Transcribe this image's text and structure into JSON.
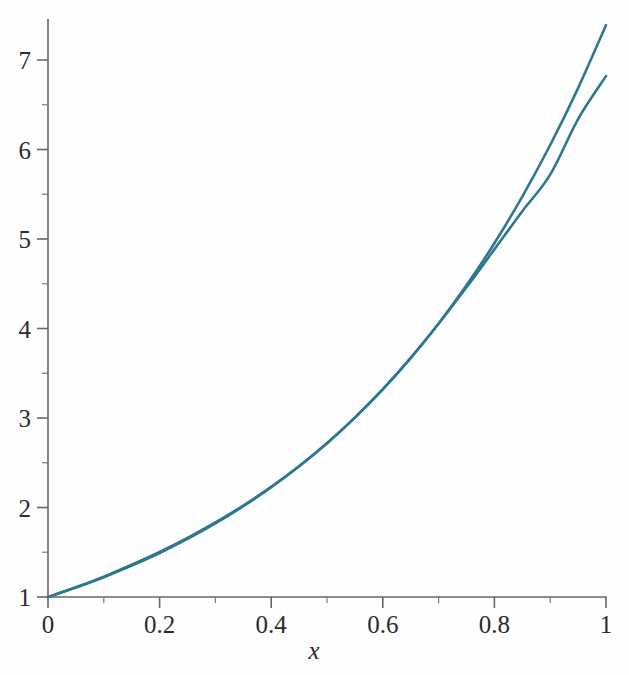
{
  "chart_data": {
    "type": "line",
    "title": "",
    "subtitle": "",
    "xlabel": "x",
    "ylabel": "",
    "xlim": [
      0,
      1
    ],
    "ylim": [
      0.92,
      7.45
    ],
    "grid": false,
    "legend": null,
    "background_color": "#fefefe",
    "axis_color": "#666666",
    "curve_color": "#2d7791",
    "x_ticks_major": [
      0,
      0.2,
      0.4,
      0.6,
      0.8,
      1
    ],
    "x_tick_labels": [
      "0",
      "0.2",
      "0.4",
      "0.6",
      "0.8",
      "1"
    ],
    "x_ticks_minor": [
      0.1,
      0.3,
      0.5,
      0.7,
      0.9
    ],
    "y_ticks_major": [
      1,
      2,
      3,
      4,
      5,
      6,
      7
    ],
    "y_tick_labels": [
      "1",
      "2",
      "3",
      "4",
      "5",
      "6",
      "7"
    ],
    "y_ticks_minor": [
      1.5,
      2.5,
      3.5,
      4.5,
      5.5,
      6.5
    ],
    "x": [
      0,
      0.05,
      0.1,
      0.15,
      0.2,
      0.25,
      0.3,
      0.35,
      0.4,
      0.45,
      0.5,
      0.55,
      0.6,
      0.65,
      0.7,
      0.75,
      0.8,
      0.85,
      0.9,
      0.95,
      1
    ],
    "series": [
      {
        "name": "exponential",
        "color": "#2d7791",
        "values": [
          1.0,
          1.105,
          1.221,
          1.35,
          1.492,
          1.649,
          1.822,
          2.014,
          2.226,
          2.46,
          2.718,
          3.004,
          3.32,
          3.669,
          4.055,
          4.482,
          4.953,
          5.474,
          6.05,
          6.686,
          7.389
        ]
      },
      {
        "name": "approximation",
        "color": "#2d7791",
        "values": [
          1.0,
          1.108,
          1.228,
          1.36,
          1.504,
          1.661,
          1.833,
          2.022,
          2.231,
          2.462,
          2.718,
          3.004,
          3.322,
          3.672,
          4.053,
          4.46,
          4.884,
          5.31,
          5.72,
          6.34,
          6.82
        ]
      }
    ]
  },
  "axis_label": {
    "x": "x"
  }
}
